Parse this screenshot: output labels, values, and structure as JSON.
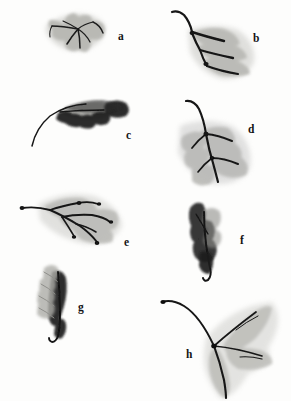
{
  "plate": {
    "title": "Ink-wash leaf study plate",
    "background_color": "#fdfdfc",
    "width": 291,
    "height": 401,
    "medium": "sumi-e ink wash",
    "ink_color": "#141414",
    "wash_color": "#9a9a96"
  },
  "figures": [
    {
      "label": "a",
      "name": "five-lobed-cluster-leaf",
      "description": "pale grey five-lobed leaf cluster with fine radiating dark veins",
      "position": {
        "x": 38,
        "y": 12,
        "w": 72,
        "h": 42
      },
      "tone": "light"
    },
    {
      "label": "b",
      "name": "long-stemmed-lanceolate-leaf",
      "description": "long curving stem with three overlapping lanceolate blades, dark midribs",
      "position": {
        "x": 168,
        "y": 10,
        "w": 78,
        "h": 72
      },
      "tone": "medium"
    },
    {
      "label": "c",
      "name": "dark-lobed-oak-leaf",
      "description": "thin arcing stem leading to a dense near-black lobed blade",
      "position": {
        "x": 30,
        "y": 98,
        "w": 100,
        "h": 48
      },
      "tone": "dark"
    },
    {
      "label": "d",
      "name": "pinnate-compound-leaf",
      "description": "upright stem with paired pinnate leaflets in soft grey wash",
      "position": {
        "x": 176,
        "y": 98,
        "w": 80,
        "h": 85
      },
      "tone": "light"
    },
    {
      "label": "e",
      "name": "horizontal-pinnate-leaf",
      "description": "horizontally oriented compound leaf, branching dark veins with dotted tips",
      "position": {
        "x": 16,
        "y": 194,
        "w": 104,
        "h": 56
      },
      "tone": "light"
    },
    {
      "label": "f",
      "name": "dark-curled-bud-leaf",
      "description": "small dark curled bud-like leaf with hooked tail tip",
      "position": {
        "x": 186,
        "y": 200,
        "w": 46,
        "h": 82
      },
      "tone": "dark"
    },
    {
      "label": "g",
      "name": "feathered-serrated-leaf",
      "description": "narrow upright leaf with feathered pale serrations over a dark core",
      "position": {
        "x": 34,
        "y": 262,
        "w": 46,
        "h": 78
      },
      "tone": "dark"
    },
    {
      "label": "h",
      "name": "trifoliate-stemmed-leaf",
      "description": "long sweeping stem ending in three splayed grey leaflets",
      "position": {
        "x": 160,
        "y": 296,
        "w": 110,
        "h": 98
      },
      "tone": "light"
    }
  ]
}
